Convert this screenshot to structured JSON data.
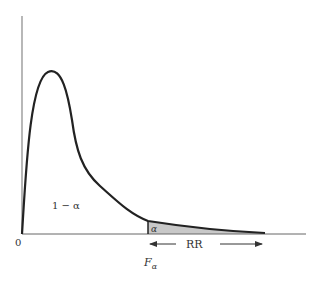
{
  "diagram": {
    "curve": "F density curve",
    "labels": {
      "origin": "0",
      "acceptance_area": "1 − α",
      "tail_area": "α",
      "critical_value_main": "F",
      "critical_value_sub": "α",
      "rejection_region": "RR"
    },
    "colors": {
      "curve": "#222222",
      "axis": "#555555",
      "shaded_tail": "#c8c8c8",
      "text": "#333333"
    }
  }
}
